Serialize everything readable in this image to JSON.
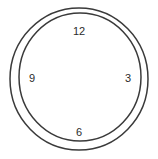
{
  "diagram": {
    "name": "clock-face",
    "background_color": "#ffffff",
    "stroke_color": "#3a3a3a",
    "stroke_width": 1.5,
    "label_color": "#2b2b2b",
    "outer_circle": {
      "center_x": 79,
      "center_y": 79,
      "radius_x": 69,
      "radius_y": 71
    },
    "inner_circle": {
      "center_x": 80,
      "center_y": 77,
      "radius_x": 61,
      "radius_y": 64
    },
    "hour_marks": [
      {
        "id": "hour-12",
        "label": "12",
        "position": "top"
      },
      {
        "id": "hour-3",
        "label": "3",
        "position": "right"
      },
      {
        "id": "hour-6",
        "label": "6",
        "position": "bottom"
      },
      {
        "id": "hour-9",
        "label": "9",
        "position": "left"
      }
    ]
  }
}
